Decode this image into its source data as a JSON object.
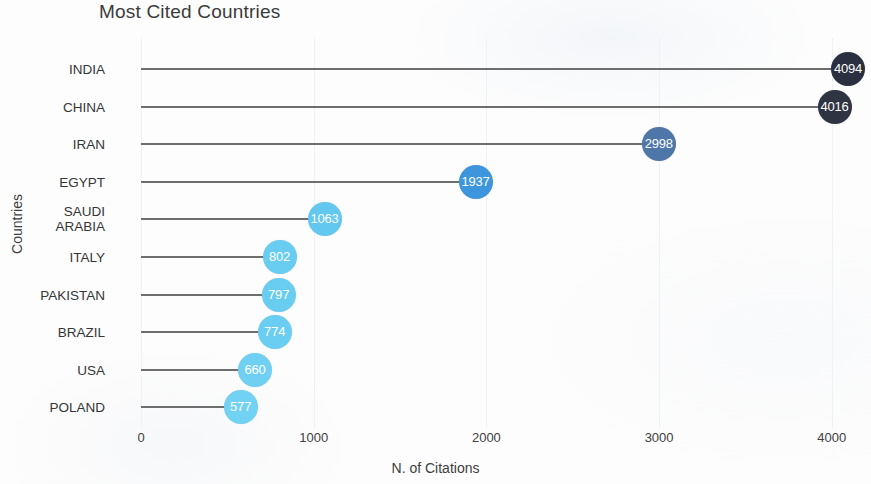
{
  "chart_data": {
    "type": "bar",
    "subtype": "lollipop",
    "title": "Most Cited Countries",
    "xlabel": "N. of Citations",
    "ylabel": "Countries",
    "categories": [
      "INDIA",
      "CHINA",
      "IRAN",
      "EGYPT",
      "SAUDI\nARABIA",
      "ITALY",
      "PAKISTAN",
      "BRAZIL",
      "USA",
      "POLAND"
    ],
    "values": [
      4094,
      4016,
      2998,
      1937,
      1063,
      802,
      797,
      774,
      660,
      577
    ],
    "value_labels": [
      "4094",
      "4016",
      "2998",
      "1937",
      "1063",
      "802",
      "797",
      "774",
      "660",
      "577"
    ],
    "point_colors": [
      "#2b3040",
      "#2f3442",
      "#4e76a8",
      "#3d96dd",
      "#62c8ef",
      "#69cdf2",
      "#69cdf2",
      "#6acdf2",
      "#6fd0f3",
      "#72d2f4"
    ],
    "xlim": [
      0,
      4250
    ],
    "xticks": [
      0,
      1000,
      2000,
      3000,
      4000
    ],
    "xtick_labels": [
      "0",
      "1000",
      "2000",
      "3000",
      "4000"
    ],
    "grid": "vertical-faint",
    "legend": "none",
    "stem_color": "#5a5a5a",
    "label_text_color": "#ffffff"
  },
  "axis": {
    "x_title": "N. of Citations",
    "y_title": "Countries"
  }
}
